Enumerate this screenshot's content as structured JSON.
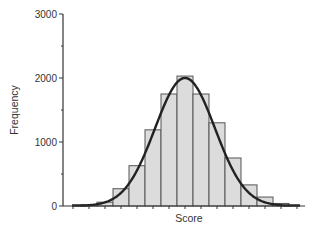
{
  "chart_data": {
    "type": "bar",
    "subtype": "histogram_with_normal_curve",
    "title": "",
    "xlabel": "Score",
    "ylabel": "Frequency",
    "ylim": [
      0,
      3000
    ],
    "yticks": [
      0,
      1000,
      2000,
      3000
    ],
    "yticks_minor": [
      500,
      1500,
      2500
    ],
    "xtick_labels": [],
    "grid": false,
    "legend": null,
    "bins": [
      1,
      2,
      3,
      4,
      5,
      6,
      7,
      8,
      9,
      10,
      11,
      12,
      13
    ],
    "values": [
      20,
      60,
      270,
      630,
      1190,
      1750,
      2030,
      1750,
      1300,
      750,
      330,
      140,
      40
    ],
    "overlay": {
      "type": "line",
      "name": "normal curve",
      "description": "Fitted normal distribution curve peaking near 2000 at the center bin"
    },
    "colors": {
      "bar_fill": "#dcdcdc",
      "bar_edge": "#555555",
      "curve": "#222222",
      "axis": "#333333"
    }
  },
  "labels": {
    "xlabel": "Score",
    "ylabel": "Frequency",
    "yticks": [
      "0",
      "1000",
      "2000",
      "3000"
    ]
  }
}
